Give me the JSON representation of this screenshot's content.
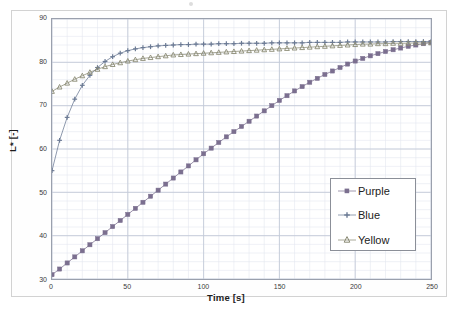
{
  "chart_data": {
    "type": "line",
    "title": "",
    "xlabel": "Time [s]",
    "ylabel": "L* [-]",
    "xlim": [
      0,
      250
    ],
    "ylim": [
      30,
      90
    ],
    "xticks": [
      0,
      50,
      100,
      150,
      200,
      250
    ],
    "yticks": [
      30,
      40,
      50,
      60,
      70,
      80,
      90
    ],
    "grid": true,
    "grid_minor": true,
    "x_minor_step": 10,
    "y_minor_step": 2,
    "legend_position": "lower right",
    "series": [
      {
        "name": "Purple",
        "marker": "square",
        "color": "#7b6f8f",
        "x": [
          0,
          5,
          10,
          15,
          20,
          25,
          30,
          35,
          40,
          45,
          50,
          55,
          60,
          65,
          70,
          75,
          80,
          85,
          90,
          95,
          100,
          105,
          110,
          115,
          120,
          125,
          130,
          135,
          140,
          145,
          150,
          155,
          160,
          165,
          170,
          175,
          180,
          185,
          190,
          195,
          200,
          205,
          210,
          215,
          220,
          225,
          230,
          235,
          240,
          245,
          250
        ],
        "y": [
          31.0,
          32.3,
          33.7,
          35.1,
          36.5,
          37.9,
          39.3,
          40.7,
          42.1,
          43.5,
          44.9,
          46.3,
          47.7,
          49.1,
          50.5,
          51.9,
          53.3,
          54.7,
          56.1,
          57.5,
          58.9,
          60.2,
          61.5,
          62.8,
          64.0,
          65.2,
          66.4,
          67.6,
          68.8,
          70.0,
          71.2,
          72.3,
          73.4,
          74.4,
          75.4,
          76.3,
          77.2,
          78.0,
          78.8,
          79.6,
          80.3,
          80.9,
          81.5,
          82.0,
          82.5,
          82.9,
          83.3,
          83.7,
          84.0,
          84.3,
          84.6
        ]
      },
      {
        "name": "Blue",
        "marker": "plus",
        "color": "#6b7a94",
        "x": [
          0,
          5,
          10,
          15,
          20,
          25,
          30,
          35,
          40,
          45,
          50,
          55,
          60,
          65,
          70,
          75,
          80,
          85,
          90,
          95,
          100,
          105,
          110,
          115,
          120,
          125,
          130,
          135,
          140,
          145,
          150,
          155,
          160,
          165,
          170,
          175,
          180,
          185,
          190,
          195,
          200,
          205,
          210,
          215,
          220,
          225,
          230,
          235,
          240,
          245,
          250
        ],
        "y": [
          55.0,
          62.0,
          67.3,
          71.5,
          74.7,
          77.0,
          78.8,
          80.2,
          81.3,
          82.1,
          82.7,
          83.1,
          83.4,
          83.6,
          83.8,
          83.9,
          84.0,
          84.1,
          84.1,
          84.2,
          84.2,
          84.2,
          84.3,
          84.3,
          84.3,
          84.4,
          84.4,
          84.4,
          84.4,
          84.5,
          84.5,
          84.5,
          84.5,
          84.5,
          84.6,
          84.6,
          84.6,
          84.6,
          84.6,
          84.7,
          84.7,
          84.7,
          84.7,
          84.7,
          84.7,
          84.8,
          84.8,
          84.8,
          84.8,
          84.8,
          84.8
        ]
      },
      {
        "name": "Yellow",
        "marker": "triangle",
        "color": "#8a8a74",
        "x": [
          0,
          5,
          10,
          15,
          20,
          25,
          30,
          35,
          40,
          45,
          50,
          55,
          60,
          65,
          70,
          75,
          80,
          85,
          90,
          95,
          100,
          105,
          110,
          115,
          120,
          125,
          130,
          135,
          140,
          145,
          150,
          155,
          160,
          165,
          170,
          175,
          180,
          185,
          190,
          195,
          200,
          205,
          210,
          215,
          220,
          225,
          230,
          235,
          240,
          245,
          250
        ],
        "y": [
          73.3,
          74.3,
          75.2,
          76.1,
          76.9,
          77.7,
          78.4,
          79.0,
          79.5,
          79.9,
          80.3,
          80.6,
          80.9,
          81.1,
          81.3,
          81.5,
          81.7,
          81.8,
          81.9,
          82.0,
          82.1,
          82.2,
          82.3,
          82.4,
          82.5,
          82.6,
          82.7,
          82.8,
          82.9,
          83.0,
          83.1,
          83.2,
          83.3,
          83.4,
          83.5,
          83.6,
          83.7,
          83.8,
          83.9,
          84.0,
          84.1,
          84.2,
          84.2,
          84.3,
          84.3,
          84.4,
          84.4,
          84.4,
          84.5,
          84.5,
          84.5
        ]
      }
    ]
  },
  "legend": {
    "items": [
      {
        "label": "Purple"
      },
      {
        "label": "Blue"
      },
      {
        "label": "Yellow"
      }
    ]
  },
  "style": {
    "grid_major_color": "#c3cad8",
    "grid_minor_color": "#e4e8ef",
    "axis_color": "#9aa0ad",
    "text_color": "#3a3a3a"
  }
}
